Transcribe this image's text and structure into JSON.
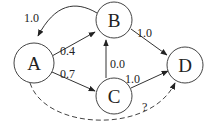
{
  "diagram": {
    "type": "directed-graph",
    "nodes": [
      {
        "id": "A",
        "label": "A",
        "cx": 34,
        "cy": 63,
        "r": 20
      },
      {
        "id": "B",
        "label": "B",
        "cx": 114,
        "cy": 20,
        "r": 18
      },
      {
        "id": "C",
        "label": "C",
        "cx": 114,
        "cy": 96,
        "r": 18
      },
      {
        "id": "D",
        "label": "D",
        "cx": 185,
        "cy": 65,
        "r": 18
      }
    ],
    "edges": [
      {
        "from": "B",
        "to": "A",
        "label": "1.0",
        "style": "solid",
        "curved": true
      },
      {
        "from": "A",
        "to": "B",
        "label": "0.4",
        "style": "solid"
      },
      {
        "from": "A",
        "to": "C",
        "label": "0.7",
        "style": "solid"
      },
      {
        "from": "C",
        "to": "B",
        "label": "0.0",
        "style": "solid"
      },
      {
        "from": "B",
        "to": "D",
        "label": "1.0",
        "style": "solid"
      },
      {
        "from": "C",
        "to": "D",
        "label": "1.0",
        "style": "solid"
      },
      {
        "from": "A",
        "to": "D",
        "label": "?",
        "style": "dashed",
        "curved": true
      }
    ],
    "colors": {
      "stroke": "#333333",
      "text": "#222222",
      "background": "#ffffff"
    }
  }
}
